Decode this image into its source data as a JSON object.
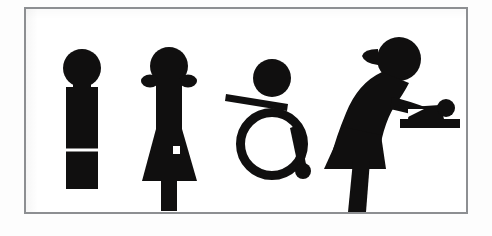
{
  "image": {
    "kind": "restroom-signage-pictogram-panel",
    "caption": "Four black restroom pictograms on a white panel with a thin gray rectangular frame",
    "background_color": "#ffffff",
    "ink_color": "#100f0f",
    "frame_color": "#8d8f92",
    "frame": {
      "x": 24,
      "y": 7,
      "width": 444,
      "height": 207,
      "border_width": 2
    }
  },
  "pictograms": [
    {
      "id": "male-figure",
      "name": "Men",
      "icon": "male-restroom-icon",
      "order": 1,
      "description": "Round head over a straight rectangular torso split near the bottom to suggest two legs",
      "parts": [
        "head",
        "torso",
        "leg-split-notch"
      ],
      "bounds": {
        "x": 62,
        "y": 47,
        "width": 37,
        "height": 140
      }
    },
    {
      "id": "female-figure",
      "name": "Women",
      "icon": "female-restroom-icon",
      "order": 2,
      "description": "Round head with two side hair buns, narrow body flaring into a skirt, single leg below, small square cut-out on the skirt",
      "parts": [
        "head",
        "left-hair-bun",
        "right-hair-bun",
        "torso",
        "skirt",
        "leg",
        "square-cutout"
      ],
      "bounds": {
        "x": 141,
        "y": 44,
        "width": 55,
        "height": 143
      }
    },
    {
      "id": "wheelchair-figure",
      "name": "Accessible",
      "icon": "wheelchair-accessible-icon",
      "order": 3,
      "description": "Round head above an angled armrest bar and a large open wheel ring with a small caster circle at the lower right",
      "parts": [
        "head",
        "armrest-bar",
        "wheel-ring",
        "caster-wheel"
      ],
      "bounds": {
        "x": 228,
        "y": 58,
        "width": 82,
        "height": 124
      }
    },
    {
      "id": "baby-changing-figure",
      "name": "Baby changing",
      "icon": "baby-changing-station-icon",
      "order": 4,
      "description": "Adult with a hair bun bending forward over an infant lying on a changing table",
      "parts": [
        "adult-head",
        "hair-bun",
        "adult-back",
        "adult-arm",
        "skirt",
        "leg",
        "baby-head",
        "baby-body",
        "changing-table"
      ],
      "bounds": {
        "x": 341,
        "y": 38,
        "width": 116,
        "height": 149
      }
    }
  ]
}
